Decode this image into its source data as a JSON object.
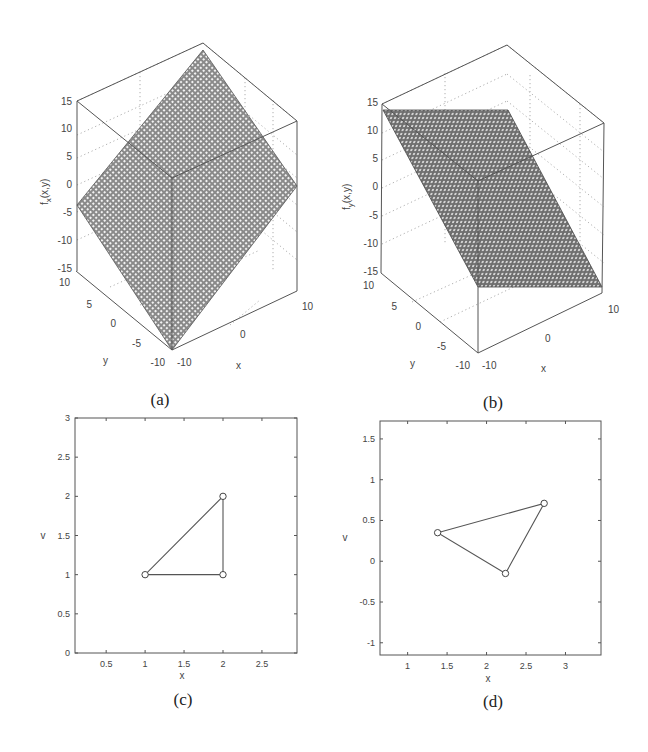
{
  "figure": {
    "captions": {
      "a": "(a)",
      "b": "(b)",
      "c": "(c)",
      "d": "(d)"
    }
  },
  "chart_data": [
    {
      "id": "a",
      "type": "surface3d",
      "title": "",
      "xlabel": "x",
      "ylabel": "y",
      "zlabel": "f_x(x,y)",
      "xlim": [
        -10,
        10
      ],
      "ylim": [
        -10,
        10
      ],
      "zlim": [
        -15,
        15
      ],
      "xticks": [
        "-10",
        "0",
        "10"
      ],
      "yticks": [
        "-10",
        "-5",
        "0",
        "5",
        "10"
      ],
      "zticks": [
        "-15",
        "-10",
        "-5",
        "0",
        "5",
        "10",
        "15"
      ],
      "description": "Tilted planar mesh surface spanning roughly -10 to 14 in z, sloping up toward back corner",
      "grid": true
    },
    {
      "id": "b",
      "type": "surface3d",
      "title": "",
      "xlabel": "x",
      "ylabel": "y",
      "zlabel": "f_y(x,y)",
      "xlim": [
        -10,
        10
      ],
      "ylim": [
        -10,
        10
      ],
      "zlim": [
        -15,
        15
      ],
      "xticks": [
        "-10",
        "0",
        "10"
      ],
      "yticks": [
        "-10",
        "-5",
        "0",
        "5",
        "10"
      ],
      "zticks": [
        "-15",
        "-10",
        "-5",
        "0",
        "5",
        "10",
        "15"
      ],
      "description": "Planar mesh surface constant in x, sloping linearly in y from about 13 (y=10) to about -12 (y=-10)",
      "grid": true
    },
    {
      "id": "c",
      "type": "line",
      "title": "",
      "xlabel": "x",
      "ylabel": "v",
      "xlim": [
        0.1,
        2.95
      ],
      "ylim": [
        0,
        3
      ],
      "xticks": [
        "0.5",
        "1",
        "1.5",
        "2",
        "2.5"
      ],
      "yticks": [
        "0",
        "0.5",
        "1",
        "1.5",
        "2",
        "2.5",
        "3"
      ],
      "series": [
        {
          "name": "triangle",
          "marker": "circle",
          "closed": true,
          "x": [
            1,
            2,
            2
          ],
          "y": [
            1,
            1,
            2
          ]
        }
      ],
      "grid": false
    },
    {
      "id": "d",
      "type": "line",
      "title": "",
      "xlabel": "x",
      "ylabel": "v",
      "xlim": [
        0.65,
        3.45
      ],
      "ylim": [
        -1.15,
        1.72
      ],
      "xticks": [
        "1",
        "1.5",
        "2",
        "2.5",
        "3"
      ],
      "yticks": [
        "-1",
        "-0.5",
        "0",
        "0.5",
        "1",
        "1.5"
      ],
      "series": [
        {
          "name": "triangle",
          "marker": "circle",
          "closed": true,
          "x": [
            1.38,
            2.73,
            2.24
          ],
          "y": [
            0.35,
            0.71,
            -0.15
          ]
        }
      ],
      "grid": false
    }
  ]
}
